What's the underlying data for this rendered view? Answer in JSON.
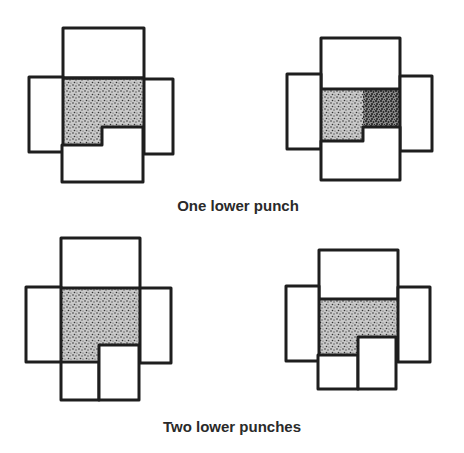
{
  "figure": {
    "captions": {
      "one_lower_punch": "One lower punch",
      "two_lower_punches": "Two lower punches"
    },
    "colors": {
      "stroke": "#1e1e1e",
      "powder_light": "#9a9a9a",
      "powder_dark": "#4a4a4a",
      "background": "#ffffff"
    },
    "panels": [
      {
        "id": "one-punch-before",
        "row": "one_lower_punch",
        "position": "left"
      },
      {
        "id": "one-punch-after",
        "row": "one_lower_punch",
        "position": "right"
      },
      {
        "id": "two-punch-before",
        "row": "two_lower_punches",
        "position": "left"
      },
      {
        "id": "two-punch-after",
        "row": "two_lower_punches",
        "position": "right"
      }
    ]
  }
}
